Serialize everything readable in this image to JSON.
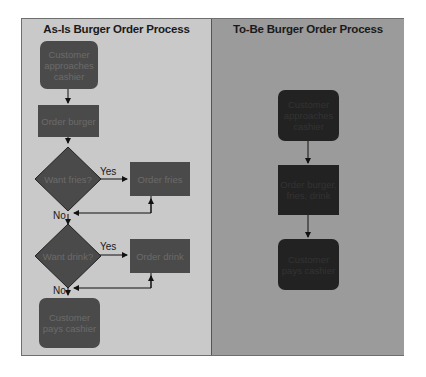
{
  "as_is": {
    "title": "As-Is Burger Order Process",
    "nodes": {
      "approach": "Customer approaches cashier",
      "order_burger": "Order burger",
      "want_fries": "Want fries?",
      "order_fries": "Order fries",
      "want_drink": "Want drink?",
      "order_drink": "Order drink",
      "pay": "Customer pays cashier"
    },
    "edge_labels": {
      "fries_yes": "Yes",
      "fries_no": "No",
      "drink_yes": "Yes",
      "drink_no": "No"
    }
  },
  "to_be": {
    "title": "To-Be Burger Order Process",
    "nodes": {
      "approach": "Customer approaches cashier",
      "order_all": "Order burger, fries, drink",
      "pay": "Customer pays cashier"
    }
  },
  "colors": {
    "left_panel": "#c9c9c9",
    "right_panel": "#9b9b9b",
    "left_node": "#4a4a4a",
    "right_node": "#222222"
  }
}
